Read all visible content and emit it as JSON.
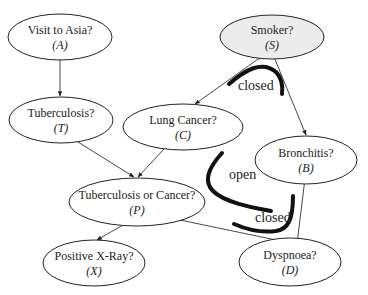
{
  "diagram": {
    "type": "bayesian-network",
    "nodes": [
      {
        "id": "A",
        "label": "Visit to Asia?",
        "var": "(A)",
        "cx": 60,
        "cy": 37,
        "rx": 52,
        "ry": 23,
        "fill": "#ffffff"
      },
      {
        "id": "S",
        "label": "Smoker?",
        "var": "(S)",
        "cx": 272,
        "cy": 37,
        "rx": 52,
        "ry": 22,
        "fill": "#ececec"
      },
      {
        "id": "T",
        "label": "Tuberculosis?",
        "var": "(T)",
        "cx": 61,
        "cy": 120,
        "rx": 52,
        "ry": 23,
        "fill": "#ffffff"
      },
      {
        "id": "C",
        "label": "Lung Cancer?",
        "var": "(C)",
        "cx": 183,
        "cy": 127,
        "rx": 60,
        "ry": 23,
        "fill": "#ffffff"
      },
      {
        "id": "B",
        "label": "Bronchitis?",
        "var": "(B)",
        "cx": 306,
        "cy": 160,
        "rx": 51,
        "ry": 24,
        "fill": "#ffffff"
      },
      {
        "id": "P",
        "label": "Tuberculosis or Cancer?",
        "var": "(P)",
        "cx": 137,
        "cy": 202,
        "rx": 68,
        "ry": 24,
        "fill": "#ffffff"
      },
      {
        "id": "X",
        "label": "Positive X-Ray?",
        "var": "(X)",
        "cx": 94,
        "cy": 263,
        "rx": 51,
        "ry": 23,
        "fill": "#ffffff"
      },
      {
        "id": "D",
        "label": "Dyspnoea?",
        "var": "(D)",
        "cx": 290,
        "cy": 262,
        "rx": 51,
        "ry": 24,
        "fill": "#ffffff"
      }
    ],
    "edges": [
      {
        "from": "A",
        "to": "T",
        "x1": 60,
        "y1": 60,
        "x2": 60,
        "y2": 96
      },
      {
        "from": "S",
        "to": "C",
        "x1": 268,
        "y1": 52,
        "x2": 195,
        "y2": 104
      },
      {
        "from": "S",
        "to": "B",
        "x1": 272,
        "y1": 52,
        "x2": 306,
        "y2": 135
      },
      {
        "from": "T",
        "to": "P",
        "x1": 78,
        "y1": 142,
        "x2": 134,
        "y2": 177
      },
      {
        "from": "C",
        "to": "P",
        "x1": 164,
        "y1": 149,
        "x2": 138,
        "y2": 177
      },
      {
        "from": "P",
        "to": "X",
        "x1": 135,
        "y1": 218,
        "x2": 97,
        "y2": 240
      },
      {
        "from": "P",
        "to": "D",
        "x1": 180,
        "y1": 220,
        "x2": 295,
        "y2": 244
      },
      {
        "from": "B",
        "to": "D",
        "x1": 306,
        "y1": 170,
        "x2": 297,
        "y2": 244
      }
    ],
    "annotations": [
      {
        "label": "closed",
        "x": 238,
        "y": 90,
        "path": "M229 84 C 245 70, 262 60, 276 72 C 282 78, 283 85, 282 94"
      },
      {
        "label": "open",
        "x": 229,
        "y": 179,
        "path": "M222 153 C 211 165, 202 180, 213 191 C 225 203, 255 208, 271 211"
      },
      {
        "label": "closed",
        "x": 255,
        "y": 222,
        "path": "M234 224 C 248 230, 262 233, 276 231 C 288 229, 293 220, 293 196"
      }
    ],
    "edge_color": "#333333",
    "stroke_color": "#222222",
    "annotation_stroke": "#111111"
  }
}
